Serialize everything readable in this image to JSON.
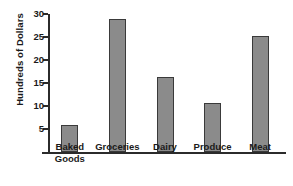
{
  "chart_data": {
    "type": "bar",
    "title": "",
    "xlabel": "",
    "ylabel": "Hundreds of Dollars",
    "categories": [
      "Baked\nGoods",
      "Groceries",
      "Dairy",
      "Produce",
      "Meat"
    ],
    "values": [
      5.8,
      29.0,
      16.3,
      10.7,
      25.3
    ],
    "ylim": [
      0,
      30
    ],
    "yticks": [
      5,
      10,
      15,
      20,
      25,
      30
    ],
    "ytick_labels": [
      "5",
      "10",
      "15",
      "20",
      "25",
      "30"
    ],
    "grid": false,
    "legend": false,
    "bar_color": "#8b8b8b",
    "bar_edge_color": "#3a3a3a",
    "axis_color": "#2b2b2b",
    "background": "#ffffff"
  }
}
